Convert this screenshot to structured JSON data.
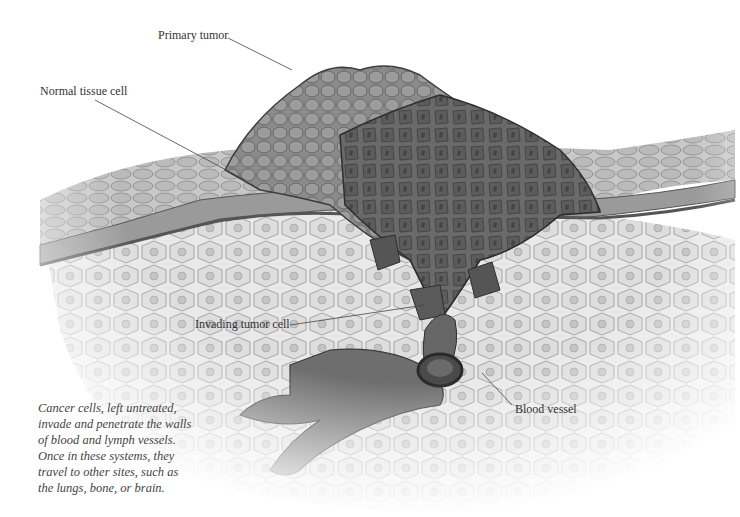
{
  "labels": {
    "primary_tumor": "Primary tumor",
    "normal_tissue_cell": "Normal tissue cell",
    "invading_tumor_cell": "Invading tumor cell",
    "blood_vessel": "Blood vessel"
  },
  "caption": {
    "lines": [
      "Cancer cells, left untreated,",
      "invade and penetrate the walls",
      "of blood and lymph vessels.",
      "Once in these systems, they",
      "travel to other sites, such as",
      "the lungs, bone, or brain."
    ]
  },
  "colors": {
    "background": "#ffffff",
    "tissue_light": "#e8e8e8",
    "cell_fill": "#dcdcdc",
    "cell_border": "#9a9a9a",
    "tumor_dark": "#5a5a5a",
    "tumor_mid": "#7a7a7a",
    "text": "#333333",
    "leader_line": "#444444"
  }
}
